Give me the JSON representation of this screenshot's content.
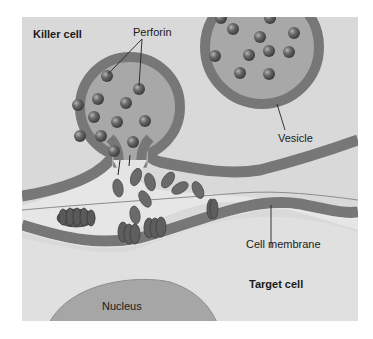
{
  "diagram": {
    "labels": {
      "killer_cell": "Killer cell",
      "perforin": "Perforin",
      "vesicle": "Vesicle",
      "cell_membrane": "Cell membrane",
      "target_cell": "Target cell",
      "nucleus": "Nucleus"
    },
    "colors": {
      "background": "#d9d9d9",
      "membrane": "#7a7a7a",
      "vesicle_fill": "#a8a8a8",
      "perforin": "#5e5e5e",
      "nucleus": "#a6a6a6",
      "synapse_fill": "#e4e4e4",
      "target_fill": "#e1e1e1",
      "page": "#ffffff"
    }
  }
}
